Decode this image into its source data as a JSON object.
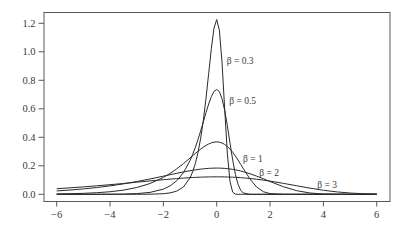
{
  "chart_data": {
    "type": "line",
    "title": "",
    "xlabel": "",
    "ylabel": "",
    "xlim": [
      -6,
      6
    ],
    "ylim": [
      0,
      1.25
    ],
    "grid": false,
    "legend": "none (inline curve labels)",
    "xticks": [
      -6,
      -4,
      -2,
      0,
      2,
      4,
      6
    ],
    "xtick_labels": [
      "−6",
      "−4",
      "−2",
      "0",
      "2",
      "4",
      "6"
    ],
    "yticks": [
      0.0,
      0.2,
      0.4,
      0.6,
      0.8,
      1.0,
      1.2
    ],
    "ytick_labels": [
      "0.0",
      "0.2",
      "0.4",
      "0.6",
      "0.8",
      "1.0",
      "1.2"
    ],
    "x": [
      -6,
      -5.5,
      -5,
      -4.5,
      -4,
      -3.5,
      -3,
      -2.5,
      -2,
      -1.75,
      -1.5,
      -1.25,
      -1,
      -0.9,
      -0.8,
      -0.7,
      -0.6,
      -0.5,
      -0.4,
      -0.3,
      -0.2,
      -0.1,
      0,
      0.1,
      0.2,
      0.3,
      0.4,
      0.5,
      0.6,
      0.7,
      0.8,
      0.9,
      1,
      1.25,
      1.5,
      1.75,
      2,
      2.5,
      3,
      3.5,
      4,
      4.5,
      5,
      5.5,
      6
    ],
    "series": [
      {
        "name": "β = 0.3",
        "values": [
          0,
          0,
          0,
          0,
          0.0,
          0.0,
          0.0002,
          0.0008,
          0.0042,
          0.0097,
          0.0223,
          0.0509,
          0.1148,
          0.1579,
          0.2161,
          0.2934,
          0.394,
          0.5212,
          0.6751,
          0.8488,
          1.0241,
          1.1667,
          1.2263,
          1.1522,
          0.9258,
          0.5979,
          0.2847,
          0.0886,
          0.0152,
          0.0011,
          0.0,
          0,
          0,
          0,
          0,
          0,
          0,
          0,
          0,
          0,
          0,
          0,
          0,
          0,
          0
        ]
      },
      {
        "name": "β = 0.5",
        "values": [
          0.0,
          0.0,
          0.0001,
          0.0002,
          0.0007,
          0.0018,
          0.0049,
          0.0134,
          0.036,
          0.0586,
          0.0947,
          0.1512,
          0.2364,
          0.2802,
          0.33,
          0.3854,
          0.4457,
          0.5093,
          0.5734,
          0.634,
          0.6858,
          0.7221,
          0.7358,
          0.7202,
          0.6712,
          0.5892,
          0.4808,
          0.3588,
          0.24,
          0.1406,
          0.07,
          0.0285,
          0.0091,
          0.0001,
          0,
          0,
          0,
          0,
          0,
          0,
          0,
          0,
          0,
          0,
          0
        ]
      },
      {
        "name": "β = 1",
        "values": [
          0.0025,
          0.0041,
          0.0067,
          0.011,
          0.018,
          0.0293,
          0.0474,
          0.0756,
          0.1182,
          0.1461,
          0.1785,
          0.2151,
          0.2546,
          0.2708,
          0.2867,
          0.3022,
          0.317,
          0.3307,
          0.3429,
          0.3532,
          0.3611,
          0.3661,
          0.3679,
          0.366,
          0.3601,
          0.35,
          0.3356,
          0.317,
          0.2946,
          0.2688,
          0.2404,
          0.2102,
          0.1794,
          0.1064,
          0.0507,
          0.0182,
          0.0046,
          0.0001,
          0,
          0,
          0,
          0,
          0,
          0,
          0
        ]
      },
      {
        "name": "β = 2",
        "values": [
          0.0237,
          0.03,
          0.0378,
          0.0474,
          0.0591,
          0.073,
          0.0893,
          0.1076,
          0.1273,
          0.1374,
          0.1473,
          0.1567,
          0.1654,
          0.1685,
          0.1715,
          0.1742,
          0.1766,
          0.1787,
          0.1805,
          0.182,
          0.1831,
          0.1837,
          0.1839,
          0.1837,
          0.183,
          0.1818,
          0.1801,
          0.1778,
          0.175,
          0.1717,
          0.1678,
          0.1634,
          0.1585,
          0.1442,
          0.1274,
          0.1089,
          0.0897,
          0.0532,
          0.0254,
          0.0091,
          0.0023,
          0.0004,
          0.0,
          0,
          0
        ]
      },
      {
        "name": "β = 3",
        "values": [
          0.0394,
          0.0454,
          0.0521,
          0.0595,
          0.0675,
          0.076,
          0.0849,
          0.0938,
          0.1024,
          0.1065,
          0.1102,
          0.1137,
          0.1167,
          0.1177,
          0.1187,
          0.1196,
          0.1204,
          0.121,
          0.1216,
          0.122,
          0.1224,
          0.1226,
          0.1226,
          0.1226,
          0.1224,
          0.122,
          0.1215,
          0.1208,
          0.12,
          0.1191,
          0.1179,
          0.1167,
          0.1152,
          0.1109,
          0.1057,
          0.0995,
          0.0926,
          0.0768,
          0.0598,
          0.0431,
          0.0285,
          0.0169,
          0.0089,
          0.004,
          0.0015
        ]
      }
    ],
    "annotations": [
      {
        "text": "β = 0.3",
        "x": 0.375,
        "y": 0.935
      },
      {
        "text": "β = 0.5",
        "x": 0.47,
        "y": 0.655
      },
      {
        "text": "β = 1",
        "x": 0.99,
        "y": 0.25
      },
      {
        "text": "β = 2",
        "x": 1.6,
        "y": 0.15
      },
      {
        "text": "β = 3",
        "x": 3.77,
        "y": 0.067
      }
    ],
    "colors": {
      "curves": "#2a2a2a",
      "axes": "#5a5a5a",
      "text": "#3a3a3a"
    }
  }
}
